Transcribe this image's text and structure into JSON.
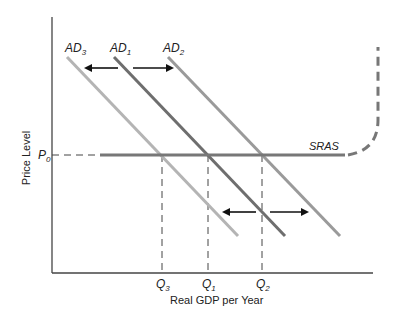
{
  "diagram": {
    "type": "AD-SRAS shift diagram",
    "axes": {
      "ylabel": "Price Level",
      "xlabel": "Real GDP per Year"
    },
    "price_level": {
      "label": "P",
      "sub": "0"
    },
    "curves": [
      {
        "id": "AD3",
        "label": "AD",
        "sub": "3",
        "color": "#b4b4b4"
      },
      {
        "id": "AD1",
        "label": "AD",
        "sub": "1",
        "color": "#6e6e6e"
      },
      {
        "id": "AD2",
        "label": "AD",
        "sub": "2",
        "color": "#9a9a9a"
      }
    ],
    "sras": {
      "label": "SRAS",
      "color": "#777777"
    },
    "quantities": [
      {
        "id": "Q3",
        "label": "Q",
        "sub": "3"
      },
      {
        "id": "Q1",
        "label": "Q",
        "sub": "1"
      },
      {
        "id": "Q2",
        "label": "Q",
        "sub": "2"
      }
    ],
    "arrows": [
      "shift-left",
      "shift-right"
    ]
  }
}
